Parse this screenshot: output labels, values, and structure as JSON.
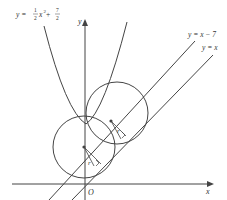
{
  "diagram": {
    "axes": {
      "x_label": "x",
      "y_label": "y",
      "origin_label": "O"
    },
    "curves": {
      "parabola": {
        "label_prefix": "y = ",
        "label_coef_num": "1",
        "label_coef_den": "2",
        "label_var": "x",
        "label_exp": "2",
        "label_plus": " + ",
        "label_const_num": "7",
        "label_const_den": "2"
      },
      "line_upper": {
        "label": "y = x − 7"
      },
      "line_lower": {
        "label": "y = x"
      }
    },
    "circles": [
      {
        "radius_label": "r"
      },
      {
        "radius_label": "r"
      }
    ],
    "colors": {
      "stroke": "#444444",
      "text": "#333333"
    }
  }
}
